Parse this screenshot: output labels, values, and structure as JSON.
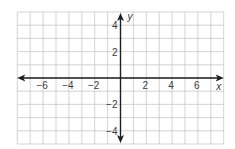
{
  "chart_data": {
    "type": "scatter",
    "title": "",
    "xlabel": "x",
    "ylabel": "y",
    "xlim": [
      -8,
      8
    ],
    "ylim": [
      -5,
      5
    ],
    "grid": true,
    "grid_step": 1,
    "x_ticks": [
      -6,
      -4,
      -2,
      2,
      4,
      6
    ],
    "x_tick_labels": [
      "−6",
      "−4",
      "−2",
      "2",
      "4",
      "6"
    ],
    "y_ticks": [
      4,
      2,
      -2,
      -4
    ],
    "y_tick_labels": [
      "4",
      "2",
      "−2",
      "−4"
    ],
    "series": [],
    "axes_arrows": true
  },
  "colors": {
    "grid": "#c8c8c8",
    "axis": "#1e1e1e",
    "text": "#3a3a3a",
    "background": "#ffffff"
  }
}
